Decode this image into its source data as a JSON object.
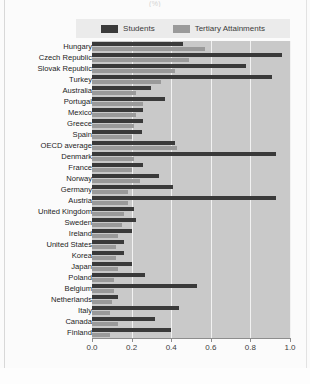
{
  "title": "(%)",
  "legend": {
    "items": [
      {
        "label": "Students",
        "color": "#3a3a3a",
        "icon": "legend-swatch-students"
      },
      {
        "label": "Tertiary Attainments",
        "color": "#9a9a9a",
        "icon": "legend-swatch-tertiary"
      }
    ]
  },
  "axis": {
    "ticks": [
      "0.0",
      "0.2",
      "0.4",
      "0.6",
      "0.8",
      "1.0"
    ],
    "min": 0,
    "max": 1
  },
  "chart_data": {
    "type": "bar",
    "orientation": "horizontal",
    "title": "(%)",
    "xlabel": "",
    "ylabel": "",
    "xlim": [
      0,
      1
    ],
    "grid": true,
    "legend_position": "top",
    "categories": [
      "Hungary",
      "Czech Republic",
      "Slovak Republic",
      "Turkey",
      "Australia",
      "Portugal",
      "Mexico",
      "Greece",
      "Spain",
      "OECD average",
      "Denmark",
      "France",
      "Norway",
      "Germany",
      "Austria",
      "United Kingdom",
      "Sweden",
      "Ireland",
      "United States",
      "Korea",
      "Japan",
      "Poland",
      "Belgium",
      "Netherlands",
      "Italy",
      "Canada",
      "Finland"
    ],
    "series": [
      {
        "name": "Students",
        "color": "#3a3a3a",
        "values": [
          0.46,
          0.96,
          0.78,
          0.91,
          0.3,
          0.37,
          0.26,
          0.26,
          0.25,
          0.42,
          0.93,
          0.26,
          0.34,
          0.41,
          0.93,
          0.21,
          0.22,
          0.2,
          0.16,
          0.16,
          0.2,
          0.27,
          0.53,
          0.13,
          0.44,
          0.32,
          0.4
        ]
      },
      {
        "name": "Tertiary Attainments",
        "color": "#9a9a9a",
        "values": [
          0.57,
          0.49,
          0.42,
          0.35,
          0.22,
          0.26,
          0.22,
          0.21,
          0.2,
          0.43,
          0.21,
          0.2,
          0.24,
          0.18,
          0.18,
          0.16,
          0.15,
          0.13,
          0.12,
          0.12,
          0.13,
          0.11,
          0.11,
          0.1,
          0.09,
          0.13,
          0.09
        ]
      }
    ]
  }
}
